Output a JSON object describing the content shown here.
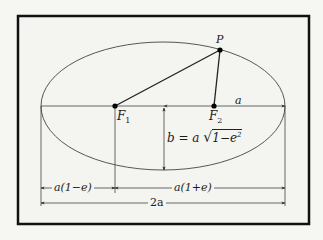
{
  "figure": {
    "type": "ellipse-geometry",
    "colors": {
      "background": "#f6f6f3",
      "panel": "#f4f4f1",
      "frame": "#111111",
      "line": "#333333",
      "point": "#000000"
    }
  },
  "labels": {
    "point_p": "P",
    "focus1": "F",
    "focus1_sub": "1",
    "focus2": "F",
    "focus2_sub": "2",
    "semi_major": "a",
    "semi_minor_lhs": "b = a ",
    "semi_minor_sqrt": "√",
    "semi_minor_radicand": "1−e",
    "semi_minor_exp": "2",
    "perihelion": "a(1−e)",
    "aphelion": "a(1+e)",
    "major_axis": "2a"
  },
  "geometry": {
    "ellipse": {
      "cx": 163,
      "cy": 106,
      "rx": 122,
      "ry": 64
    },
    "focus1": {
      "x": 115,
      "y": 106
    },
    "focus2": {
      "x": 214,
      "y": 106
    },
    "point_p": {
      "x": 220,
      "y": 50
    }
  }
}
